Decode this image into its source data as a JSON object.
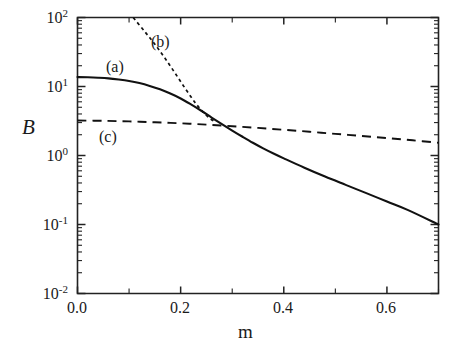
{
  "figure": {
    "width": 460,
    "height": 349,
    "background": "#ffffff",
    "ink_color": "#111111"
  },
  "chart_data": {
    "type": "line",
    "title": "",
    "subtitle": "",
    "xlabel": "m",
    "ylabel": "B",
    "xscale": "linear",
    "yscale": "log",
    "xlim": [
      0.0,
      0.7
    ],
    "ylim": [
      0.01,
      100
    ],
    "grid": false,
    "legend": "inline-curve-labels",
    "x_ticks_major": [
      0.0,
      0.2,
      0.4,
      0.6
    ],
    "x_ticks_major_labels": [
      "0.0",
      "0.2",
      "0.4",
      "0.6"
    ],
    "x_ticks_minor": [
      0.1,
      0.3,
      0.5,
      0.7
    ],
    "y_ticks_major": [
      0.01,
      0.1,
      1,
      10,
      100
    ],
    "y_ticks_major_labels": [
      "10-2",
      "10-1",
      "100",
      "101",
      "102"
    ],
    "y_tick_mantissas": [
      "10",
      "10",
      "10",
      "10",
      "10"
    ],
    "y_tick_exponents": [
      "-2",
      "-1",
      "0",
      "1",
      "2"
    ],
    "series": [
      {
        "name": "(a)",
        "style": "solid",
        "label": "(a)",
        "label_x": 0.075,
        "label_y": 30.0,
        "x": [
          0.0,
          0.02,
          0.04,
          0.06,
          0.08,
          0.1,
          0.12,
          0.14,
          0.16,
          0.18,
          0.2,
          0.22,
          0.24,
          0.26,
          0.28,
          0.3,
          0.32,
          0.34,
          0.36,
          0.38,
          0.4,
          0.44,
          0.48,
          0.52,
          0.56,
          0.6,
          0.64,
          0.7
        ],
        "values": [
          13.7,
          13.6,
          13.4,
          13.1,
          12.6,
          12.0,
          11.2,
          10.2,
          9.1,
          7.9,
          6.7,
          5.5,
          4.45,
          3.55,
          2.85,
          2.3,
          1.87,
          1.53,
          1.27,
          1.07,
          0.91,
          0.665,
          0.495,
          0.375,
          0.285,
          0.215,
          0.163,
          0.1
        ]
      },
      {
        "name": "(b)",
        "style": "dotted",
        "label": "(b)",
        "label_x": 0.155,
        "label_y": 46.0,
        "x": [
          0.108,
          0.13,
          0.15,
          0.17,
          0.19,
          0.21,
          0.23,
          0.25,
          0.268
        ],
        "values": [
          100.0,
          63.0,
          41.0,
          25.5,
          15.3,
          9.1,
          5.6,
          3.8,
          3.0
        ]
      },
      {
        "name": "(c)",
        "style": "dashed",
        "label": "(c)",
        "label_x": 0.055,
        "label_y": 1.55,
        "x": [
          0.0,
          0.05,
          0.1,
          0.15,
          0.2,
          0.25,
          0.3,
          0.35,
          0.4,
          0.45,
          0.5,
          0.55,
          0.6,
          0.65,
          0.7
        ],
        "values": [
          3.22,
          3.18,
          3.12,
          3.03,
          2.93,
          2.8,
          2.66,
          2.51,
          2.36,
          2.21,
          2.06,
          1.92,
          1.79,
          1.66,
          1.53
        ]
      }
    ],
    "annotations": [
      {
        "text": "(a)",
        "note": "solid curve label"
      },
      {
        "text": "(b)",
        "note": "dotted curve label"
      },
      {
        "text": "(c)",
        "note": "dashed curve label"
      }
    ]
  }
}
